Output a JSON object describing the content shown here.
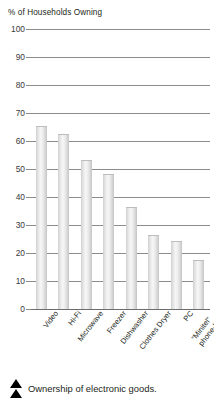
{
  "chart_data": {
    "type": "bar",
    "title": "",
    "ylabel": "% of Households Owning",
    "xlabel": "",
    "ylim": [
      0,
      100
    ],
    "ytick_values": [
      100,
      90,
      80,
      70,
      60,
      50,
      40,
      30,
      20,
      10,
      0
    ],
    "ytick_labels": [
      "100",
      "90",
      "80",
      "70",
      "60",
      "50",
      "40",
      "30",
      "20",
      "10",
      "0"
    ],
    "grid": true,
    "legend": "none",
    "categories": [
      "Video",
      "Hi-Fi",
      "Microwave",
      "Freezer",
      "Dishwasher",
      "Clothes Dryer",
      "PC",
      "“Minitel” phone-link"
    ],
    "category_lines": [
      [
        "Video"
      ],
      [
        "Hi-Fi"
      ],
      [
        "Microwave"
      ],
      [
        "Freezer"
      ],
      [
        "Dishwasher"
      ],
      [
        "Clothes Dryer"
      ],
      [
        "PC"
      ],
      [
        "“Minitel”",
        "phone-link"
      ]
    ],
    "values": [
      65,
      62,
      53,
      48,
      36,
      26,
      24,
      17
    ]
  },
  "caption": {
    "text": "Ownership of electronic goods.",
    "marker": "double-triangle-up"
  },
  "colors": {
    "bar_light": "#f6f6f6",
    "bar_mid": "#e0e0e0",
    "bar_dark": "#c4c4c4",
    "gridline": "#8c8c8c",
    "text": "#231f20",
    "background": "#ffffff"
  }
}
